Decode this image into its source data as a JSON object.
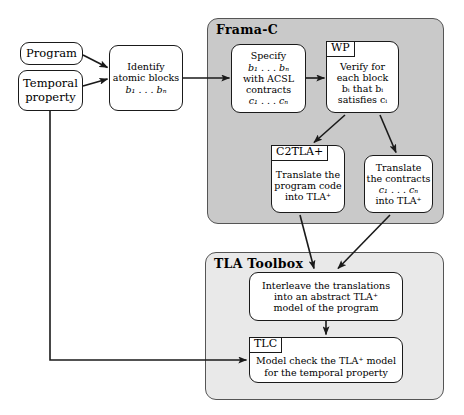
{
  "figure": {
    "width": 464,
    "height": 415,
    "background": "#ffffff",
    "line_color": "#1a1a1a"
  },
  "containers": {
    "frama_c": {
      "title": "Frama-C",
      "fill": "#c9c9c9",
      "border": "#555555"
    },
    "tla_toolbox": {
      "title": "TLA Toolbox",
      "fill": "#e9e9e9",
      "border": "#555555"
    }
  },
  "nodes": {
    "program": {
      "lines": [
        "Program"
      ]
    },
    "temporal_property": {
      "lines": [
        "Temporal",
        "property"
      ]
    },
    "identify_blocks": {
      "lines": [
        "Identify",
        "atomic blocks"
      ],
      "formula": "b₁ . . . bₙ"
    },
    "specify_contracts": {
      "lines": [
        "Specify",
        "b₁ . . . bₙ",
        "with ACSL",
        "contracts",
        "c₁ . . . cₙ"
      ]
    },
    "wp_verify": {
      "tag": "WP",
      "lines": [
        "Verify for",
        "each block",
        "bᵢ that bᵢ",
        "satisfies cᵢ"
      ]
    },
    "c2tla_translate": {
      "tag": "C2TLA+",
      "lines": [
        "Translate the",
        "program code",
        "into TLA⁺"
      ]
    },
    "translate_contracts": {
      "lines": [
        "Translate",
        "the contracts",
        "c₁ . . . cₙ",
        "into TLA⁺"
      ]
    },
    "interleave": {
      "lines": [
        "Interleave the translations",
        "into an abstract TLA⁺",
        "model of the program"
      ]
    },
    "tlc_model_check": {
      "tag": "TLC",
      "lines": [
        "Model check the TLA⁺ model",
        "for the temporal property"
      ]
    }
  },
  "edges": [
    {
      "name": "program-to-identify"
    },
    {
      "name": "temporal-property-to-identify"
    },
    {
      "name": "identify-to-specify"
    },
    {
      "name": "specify-to-wp"
    },
    {
      "name": "wp-to-c2tla"
    },
    {
      "name": "wp-to-translate-contracts"
    },
    {
      "name": "c2tla-to-interleave"
    },
    {
      "name": "translate-contracts-to-interleave"
    },
    {
      "name": "interleave-to-tlc"
    },
    {
      "name": "temporal-property-to-tlc"
    }
  ]
}
